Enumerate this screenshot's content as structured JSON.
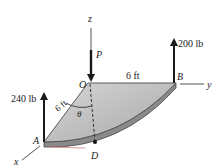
{
  "diagram": {
    "axes": {
      "x": "x",
      "y": "y",
      "z": "z"
    },
    "points": {
      "O": "O",
      "A": "A",
      "B": "B",
      "D": "D"
    },
    "dimensions": {
      "OB": "6 ft",
      "OA": "6 ft"
    },
    "angle": "θ",
    "loads": {
      "P": "P",
      "B_load": "200 lb",
      "A_load": "240 lb"
    },
    "colors": {
      "plate_fill": "#b9b9b9",
      "plate_edge": "#5a5a5a",
      "arrow": "#1a1a1a",
      "axis": "#444444"
    }
  }
}
